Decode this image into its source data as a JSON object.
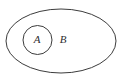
{
  "diagram": {
    "kind": "euler-diagram",
    "background_color": "#ffffff",
    "stroke_color": "#3c3c3c",
    "label_color": "#2e2e2e",
    "outer_set": {
      "name": "outer-set-ellipse",
      "label": "B",
      "shape": "ellipse",
      "cx": 61,
      "cy": 41,
      "rx": 55,
      "ry": 32,
      "label_x": 63,
      "label_y": 40
    },
    "inner_set": {
      "name": "inner-set-circle",
      "label": "A",
      "shape": "circle",
      "cx": 37.5,
      "cy": 40,
      "r": 14.5,
      "label_x": 37,
      "label_y": 40
    }
  }
}
